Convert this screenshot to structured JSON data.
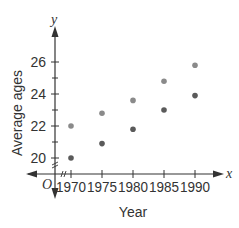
{
  "chart_data": {
    "type": "scatter",
    "title": "",
    "xlabel": "Year",
    "ylabel": "Average ages",
    "x_axis_var": "x",
    "y_axis_var": "y",
    "origin_label": "O",
    "x": [
      1970,
      1975,
      1980,
      1985,
      1990
    ],
    "x_tick_labels": [
      "1970",
      "1975",
      "1980",
      "1985",
      "1990"
    ],
    "y_tick_labels": [
      "20",
      "22",
      "24",
      "26"
    ],
    "y_ticks_minor": [
      21,
      23,
      25
    ],
    "ylim": [
      19,
      27
    ],
    "xlim": [
      1965,
      1993
    ],
    "grid": false,
    "legend": null,
    "axis_breaks": true,
    "series": [
      {
        "name": "upper",
        "color": "#8a8a8a",
        "values": [
          22.0,
          22.8,
          23.6,
          24.8,
          25.8
        ]
      },
      {
        "name": "lower",
        "color": "#5a5a5a",
        "values": [
          20.0,
          20.9,
          21.8,
          23.0,
          23.9
        ]
      }
    ]
  },
  "colors": {
    "axis": "#333333",
    "text": "#333333"
  }
}
